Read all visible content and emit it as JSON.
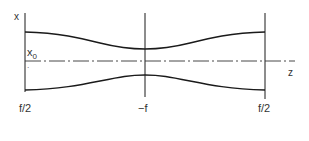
{
  "diagram": {
    "type": "gaussian-beam-envelope",
    "axis_labels": {
      "vertical": "x",
      "horizontal": "z"
    },
    "annotations": {
      "waist_label": "x",
      "waist_subscript": "0"
    },
    "planes": [
      {
        "label": "f/2",
        "position": "left"
      },
      {
        "label": "−f",
        "position": "center"
      },
      {
        "label": "f/2",
        "position": "right"
      }
    ],
    "colors": {
      "line": "#1a1a1a",
      "text": "#333333",
      "background": "#ffffff"
    }
  }
}
